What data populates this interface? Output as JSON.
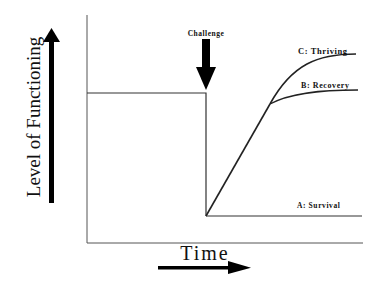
{
  "diagram": {
    "y_axis_label": "Level of Functioning",
    "x_axis_label": "Time",
    "event_label": "Challenge",
    "curves": [
      {
        "id": "A",
        "label": "A: Survival"
      },
      {
        "id": "B",
        "label": "B: Recovery"
      },
      {
        "id": "C",
        "label": "C: Thriving"
      }
    ],
    "colors": {
      "line": "#222222",
      "frame": "#555555",
      "arrow": "#000000",
      "background": "#ffffff"
    }
  }
}
